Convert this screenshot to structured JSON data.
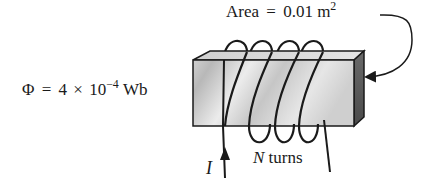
{
  "figure": {
    "type": "solenoid-core-diagram",
    "colors": {
      "ink": "#1a1a1a",
      "core_front_light": "#e8e8e8",
      "core_front_dark": "#b4b4b4",
      "core_top": "#d6d6d6",
      "core_side": "#5a5a5a",
      "background": "#ffffff"
    }
  },
  "labels": {
    "area": {
      "prefix": "Area",
      "equals": "=",
      "value": "0.01 m",
      "exponent": "2"
    },
    "flux": {
      "symbol": "Φ",
      "equals": "=",
      "coefficient": "4",
      "times": "×",
      "base": "10",
      "exponent": "−4",
      "unit": "Wb"
    },
    "current": {
      "symbol": "I"
    },
    "turns": {
      "symbol": "N",
      "text": "turns"
    }
  },
  "coil": {
    "visible_turns": 4
  }
}
